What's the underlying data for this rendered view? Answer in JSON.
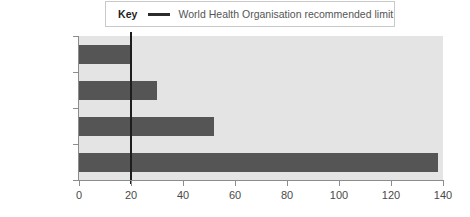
{
  "legend": {
    "key_label": "Key",
    "swatch_name": "who-limit-line-swatch",
    "entry_text": "World Health Organisation recommended limit"
  },
  "chart_data": {
    "type": "bar",
    "orientation": "horizontal",
    "title": "",
    "xlabel": "",
    "ylabel": "",
    "categories": [
      "New York City",
      "London",
      "Mexico City",
      "Mumbai"
    ],
    "values": [
      20,
      30,
      52,
      138
    ],
    "series": [
      {
        "name": "Annual mean particulate level",
        "values": [
          20,
          30,
          52,
          138
        ]
      }
    ],
    "xlim": [
      0,
      140
    ],
    "xticks": [
      0,
      20,
      40,
      60,
      80,
      100,
      120,
      140
    ],
    "xtick_labels": [
      "0",
      "20",
      "40",
      "60",
      "80",
      "100",
      "120",
      "140"
    ],
    "grid": false,
    "legend_position": "top",
    "annotations": [
      {
        "name": "who-recommended-limit",
        "type": "vertical-line",
        "value": 20,
        "label": "World Health Organisation recommended limit"
      }
    ],
    "colors": {
      "bar": "#555555",
      "plot_background": "#e4e4e4",
      "who_line": "#1d1d1d",
      "axis": "#8c8c8c",
      "text": "#2b2b2b"
    }
  }
}
